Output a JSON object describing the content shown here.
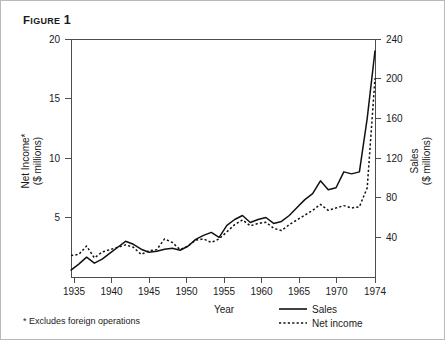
{
  "figure": {
    "title_prefix": "F",
    "title_word": "IGURE",
    "title_number": "1",
    "title_full": "FIGURE 1"
  },
  "footnote": {
    "text": "* Excludes foreign operations"
  },
  "legend": {
    "position": "bottom-right",
    "items": [
      {
        "label": "Sales",
        "style": "solid"
      },
      {
        "label": "Net income",
        "style": "dotted"
      }
    ]
  },
  "chart_data": {
    "type": "line",
    "xlabel": "Year",
    "ylabel": "Net Income* ($ millions)",
    "y2label": "Sales ($ millions)",
    "ylim": [
      0,
      20
    ],
    "y2lim": [
      0,
      240
    ],
    "xlim": [
      1935,
      1974
    ],
    "grid": false,
    "left_axis_label_line1": "Net Income*",
    "left_axis_label_line2": "($ millions)",
    "right_axis_label_line1": "Sales",
    "right_axis_label_line2": "($ millions)",
    "x_tick_labels": [
      "1935",
      "1940",
      "1945",
      "1950",
      "1955",
      "1960",
      "1965",
      "1970",
      "1974"
    ],
    "x_tick_values": [
      1935,
      1940,
      1945,
      1950,
      1955,
      1960,
      1965,
      1970,
      1974
    ],
    "y_tick_labels": [
      "5",
      "10",
      "15",
      "20"
    ],
    "y_tick_values": [
      5,
      10,
      15,
      20
    ],
    "y2_tick_labels": [
      "40",
      "80",
      "120",
      "160",
      "200",
      "240"
    ],
    "y2_tick_values": [
      40,
      80,
      120,
      160,
      200,
      240
    ],
    "x": [
      1935,
      1936,
      1937,
      1938,
      1939,
      1940,
      1941,
      1942,
      1943,
      1944,
      1945,
      1946,
      1947,
      1948,
      1949,
      1950,
      1951,
      1952,
      1953,
      1954,
      1955,
      1956,
      1957,
      1958,
      1959,
      1960,
      1961,
      1962,
      1963,
      1964,
      1965,
      1966,
      1967,
      1968,
      1969,
      1970,
      1971,
      1972,
      1973,
      1974
    ],
    "series": [
      {
        "name": "Sales",
        "axis": "right",
        "units": "$ millions",
        "style": "solid",
        "values": [
          7,
          13,
          20,
          14,
          18,
          24,
          30,
          36,
          33,
          28,
          25,
          26,
          28,
          29,
          27,
          31,
          38,
          42,
          45,
          40,
          52,
          58,
          62,
          55,
          58,
          60,
          54,
          56,
          62,
          70,
          78,
          84,
          97,
          88,
          90,
          106,
          104,
          106,
          160,
          228
        ]
      },
      {
        "name": "Net income",
        "axis": "left",
        "units": "$ millions",
        "style": "dotted",
        "values": [
          1.8,
          1.9,
          2.6,
          1.6,
          2.1,
          2.3,
          2.5,
          2.7,
          2.5,
          1.9,
          2.2,
          2.3,
          3.2,
          2.9,
          2.3,
          2.6,
          3.1,
          3.2,
          2.9,
          3.2,
          3.8,
          4.4,
          4.8,
          4.3,
          4.5,
          4.6,
          4.1,
          3.9,
          4.4,
          4.8,
          5.2,
          5.6,
          6.1,
          5.6,
          5.8,
          6.0,
          5.8,
          5.9,
          7.5,
          16.7
        ]
      }
    ],
    "annotations": [
      {
        "text": "* Excludes foreign operations",
        "position": "below-axis-left"
      }
    ]
  }
}
